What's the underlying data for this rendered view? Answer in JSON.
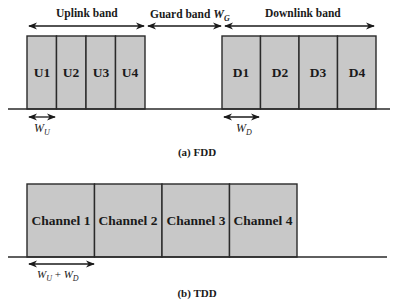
{
  "fdd": {
    "caption": "(a) FDD",
    "uplink_label": "Uplink band",
    "guard_label": "Guard band",
    "guard_symbol": "W",
    "guard_sub": "G",
    "downlink_label": "Downlink band",
    "uplink_channels": [
      "U1",
      "U2",
      "U3",
      "U4"
    ],
    "downlink_channels": [
      "D1",
      "D2",
      "D3",
      "D4"
    ],
    "wu_symbol": "W",
    "wu_sub": "U",
    "wd_symbol": "W",
    "wd_sub": "D"
  },
  "tdd": {
    "caption": "(b) TDD",
    "channels": [
      "Channel 1",
      "Channel 2",
      "Channel 3",
      "Channel 4"
    ],
    "width_symbol_1": "W",
    "width_sub_1": "U",
    "width_plus": " + ",
    "width_symbol_2": "W",
    "width_sub_2": "D"
  },
  "colors": {
    "box_fill": "#c8c8c8",
    "stroke": "#2a2a2a"
  }
}
